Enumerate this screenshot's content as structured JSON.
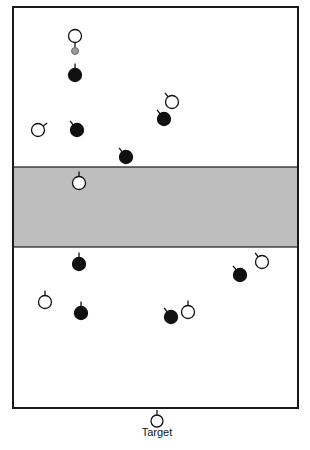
{
  "diagram": {
    "title": "",
    "field": {
      "x": 13,
      "y": 7,
      "width": 285,
      "height": 401,
      "border_color": "#1a1a1a",
      "fill": "#ffffff"
    },
    "neutral_zone": {
      "x": 13,
      "y": 167,
      "width": 285,
      "height": 80,
      "fill": "#bdbdbd"
    },
    "colors": {
      "attacker": "#111111",
      "defender": "#ffffff",
      "ball": "#9a9a9a",
      "stroke": "#111111"
    },
    "target_label": "Target",
    "target": {
      "x": 157,
      "y": 421
    },
    "players_dark": [
      {
        "x": 75,
        "y": 75,
        "dir": "up"
      },
      {
        "x": 77,
        "y": 130,
        "dir": "upleft"
      },
      {
        "x": 126,
        "y": 157,
        "dir": "upleft"
      },
      {
        "x": 164,
        "y": 119,
        "dir": "upleft"
      },
      {
        "x": 79,
        "y": 264,
        "dir": "up"
      },
      {
        "x": 81,
        "y": 313,
        "dir": "up"
      },
      {
        "x": 171,
        "y": 317,
        "dir": "upleft"
      },
      {
        "x": 240,
        "y": 275,
        "dir": "upleft"
      }
    ],
    "players_light": [
      {
        "x": 75,
        "y": 36,
        "dir": "down"
      },
      {
        "x": 38,
        "y": 130,
        "dir": "upright"
      },
      {
        "x": 172,
        "y": 102,
        "dir": "upleft"
      },
      {
        "x": 79,
        "y": 183,
        "dir": "up"
      },
      {
        "x": 262,
        "y": 262,
        "dir": "upleft"
      },
      {
        "x": 45,
        "y": 302,
        "dir": "up"
      },
      {
        "x": 188,
        "y": 312,
        "dir": "up"
      }
    ],
    "ball": {
      "x": 75,
      "y": 51
    }
  }
}
